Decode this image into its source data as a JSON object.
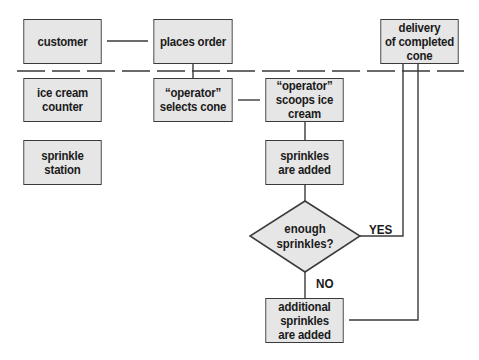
{
  "diagram": {
    "type": "swimlane-flowchart",
    "lanes_divider": "dashed",
    "colors": {
      "box_fill": "#e6e6e6",
      "box_border": "#3a3a3a",
      "line": "#3a3a3a",
      "text": "#1a1a1a"
    },
    "nodes": {
      "customer": "customer",
      "places_order": "places order",
      "delivery": "delivery\nof completed\ncone",
      "ice_cream_counter": "ice cream\ncounter",
      "operator_selects_cone": "“operator”\nselects cone",
      "operator_scoops": "“operator”\nscoops ice\ncream",
      "sprinkle_station": "sprinkle\nstation",
      "sprinkles_added": "sprinkles\nare added",
      "decision": "enough\nsprinkles?",
      "additional_sprinkles": "additional\nsprinkles\nare added"
    },
    "edge_labels": {
      "yes": "YES",
      "no": "NO"
    },
    "edges": [
      {
        "from": "customer",
        "to": "places_order"
      },
      {
        "from": "places_order",
        "to": "operator_selects_cone"
      },
      {
        "from": "operator_selects_cone",
        "to": "operator_scoops"
      },
      {
        "from": "operator_scoops",
        "to": "sprinkles_added"
      },
      {
        "from": "sprinkles_added",
        "to": "decision"
      },
      {
        "from": "decision",
        "to": "delivery",
        "label": "YES"
      },
      {
        "from": "decision",
        "to": "additional_sprinkles",
        "label": "NO"
      },
      {
        "from": "additional_sprinkles",
        "to": "delivery"
      }
    ]
  }
}
